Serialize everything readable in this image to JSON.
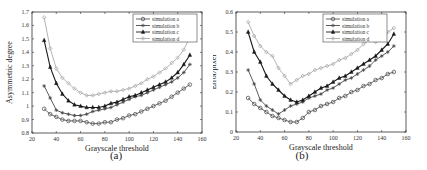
{
  "chart_data": [
    {
      "type": "line",
      "panel_label": "(a)",
      "title": "",
      "xlabel": "Grayscale threshold",
      "ylabel": "Asymmetric degree",
      "xlim": [
        20,
        160
      ],
      "ylim": [
        0.8,
        1.7
      ],
      "xticks": [
        20,
        40,
        60,
        80,
        100,
        120,
        140,
        160
      ],
      "yticks": [
        0.8,
        0.9,
        1,
        1.1,
        1.2,
        1.3,
        1.4,
        1.5,
        1.6,
        1.7
      ],
      "ytick_labels": [
        "0.8",
        "0.9",
        "1",
        "1.1",
        "1.2",
        "1.3",
        "1.4",
        "1.5",
        "1.6",
        "1.7"
      ],
      "grid": false,
      "legend_position": "upper right",
      "x": [
        30,
        35,
        40,
        45,
        50,
        55,
        60,
        65,
        70,
        75,
        80,
        85,
        90,
        95,
        100,
        105,
        110,
        115,
        120,
        125,
        130,
        135,
        140,
        145,
        150
      ],
      "series": [
        {
          "name": "simulation a",
          "color": "#555555",
          "marker": "circle",
          "values": [
            0.98,
            0.94,
            0.92,
            0.9,
            0.89,
            0.89,
            0.89,
            0.88,
            0.87,
            0.87,
            0.88,
            0.88,
            0.9,
            0.91,
            0.93,
            0.94,
            0.96,
            0.98,
            1.0,
            1.02,
            1.04,
            1.07,
            1.1,
            1.13,
            1.16
          ]
        },
        {
          "name": "simulation b",
          "color": "#4a4a4a",
          "marker": "star",
          "values": [
            1.15,
            1.06,
            0.97,
            0.95,
            0.94,
            0.93,
            0.93,
            0.94,
            0.96,
            0.97,
            0.98,
            0.99,
            1.01,
            1.03,
            1.05,
            1.07,
            1.08,
            1.1,
            1.12,
            1.14,
            1.16,
            1.18,
            1.21,
            1.25,
            1.31
          ]
        },
        {
          "name": "simulation c",
          "color": "#1a1a1a",
          "marker": "triangle",
          "values": [
            1.49,
            1.29,
            1.17,
            1.09,
            1.04,
            1.01,
            1.0,
            0.99,
            0.99,
            0.99,
            1.0,
            1.02,
            1.03,
            1.05,
            1.07,
            1.08,
            1.1,
            1.12,
            1.14,
            1.16,
            1.18,
            1.21,
            1.25,
            1.31,
            1.38
          ]
        },
        {
          "name": "simulation d",
          "color": "#aaaaaa",
          "marker": "diamond",
          "values": [
            1.66,
            1.43,
            1.28,
            1.21,
            1.17,
            1.13,
            1.1,
            1.08,
            1.08,
            1.09,
            1.1,
            1.11,
            1.11,
            1.12,
            1.13,
            1.15,
            1.17,
            1.2,
            1.22,
            1.25,
            1.28,
            1.32,
            1.36,
            1.42,
            1.51
          ]
        }
      ]
    },
    {
      "type": "line",
      "panel_label": "(b)",
      "title": "",
      "xlabel": "Grayscale threshold",
      "ylabel": "Error/pixel",
      "xlim": [
        20,
        160
      ],
      "ylim": [
        0,
        0.6
      ],
      "xticks": [
        20,
        40,
        60,
        80,
        100,
        120,
        140,
        160
      ],
      "yticks": [
        0,
        0.1,
        0.2,
        0.3,
        0.4,
        0.5,
        0.6
      ],
      "ytick_labels": [
        "0",
        "0.1",
        "0.2",
        "0.3",
        "0.4",
        "0.5",
        "0.6"
      ],
      "grid": false,
      "legend_position": "upper right",
      "x": [
        30,
        35,
        40,
        45,
        50,
        55,
        60,
        65,
        70,
        75,
        80,
        85,
        90,
        95,
        100,
        105,
        110,
        115,
        120,
        125,
        130,
        135,
        140,
        145,
        150
      ],
      "series": [
        {
          "name": "simulation a",
          "color": "#555555",
          "marker": "circle",
          "values": [
            0.17,
            0.14,
            0.12,
            0.1,
            0.08,
            0.07,
            0.06,
            0.05,
            0.05,
            0.07,
            0.1,
            0.11,
            0.13,
            0.14,
            0.15,
            0.17,
            0.18,
            0.2,
            0.21,
            0.23,
            0.24,
            0.26,
            0.27,
            0.29,
            0.3
          ]
        },
        {
          "name": "simulation b",
          "color": "#4a4a4a",
          "marker": "star",
          "values": [
            0.31,
            0.24,
            0.16,
            0.13,
            0.11,
            0.09,
            0.11,
            0.13,
            0.14,
            0.15,
            0.17,
            0.18,
            0.19,
            0.21,
            0.22,
            0.24,
            0.26,
            0.27,
            0.29,
            0.31,
            0.33,
            0.36,
            0.38,
            0.4,
            0.43
          ]
        },
        {
          "name": "simulation c",
          "color": "#1a1a1a",
          "marker": "triangle",
          "values": [
            0.5,
            0.4,
            0.35,
            0.28,
            0.24,
            0.21,
            0.18,
            0.16,
            0.15,
            0.16,
            0.18,
            0.2,
            0.22,
            0.23,
            0.25,
            0.27,
            0.28,
            0.3,
            0.32,
            0.34,
            0.36,
            0.38,
            0.41,
            0.44,
            0.49
          ]
        },
        {
          "name": "simulation d",
          "color": "#aaaaaa",
          "marker": "diamond",
          "values": [
            0.55,
            0.48,
            0.43,
            0.4,
            0.38,
            0.32,
            0.28,
            0.24,
            0.26,
            0.28,
            0.29,
            0.31,
            0.32,
            0.33,
            0.34,
            0.36,
            0.37,
            0.39,
            0.41,
            0.44,
            0.46,
            0.45,
            0.46,
            0.5,
            0.52
          ]
        }
      ]
    }
  ]
}
